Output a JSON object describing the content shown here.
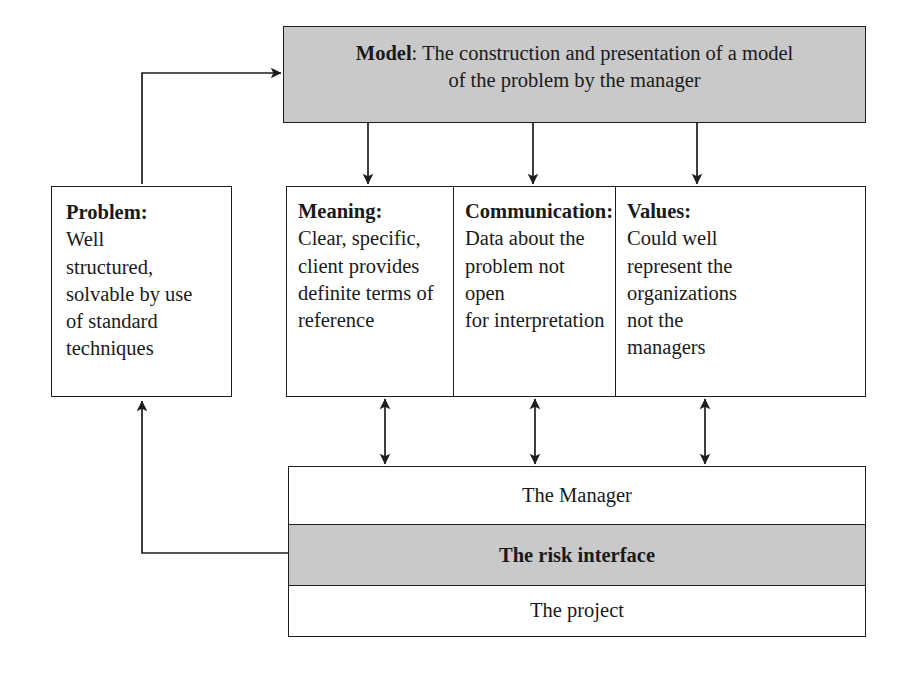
{
  "diagram": {
    "colors": {
      "shade": "#c9c9c9",
      "line": "#1d1d1d",
      "background": "#ffffff"
    },
    "model": {
      "header": "Model",
      "separator": ": ",
      "line1_rest": "The construction and presentation of a model",
      "line2": "of the problem by the manager",
      "shaded": "true"
    },
    "problem": {
      "header": "Problem:",
      "body": "Well structured, solvable by use of standard techniques",
      "lines": [
        "Well",
        "structured,",
        "solvable by use",
        "of standard",
        "techniques"
      ]
    },
    "columns": [
      {
        "header": "Meaning:",
        "body": "Clear, specific, client provides definite terms of reference",
        "lines": [
          "Clear, specific,",
          "client provides",
          "definite terms of",
          "reference"
        ]
      },
      {
        "header": "Communication:",
        "body": "Data about the problem not open for interpretation",
        "lines": [
          "Data about the",
          "problem not open",
          "for interpretation"
        ]
      },
      {
        "header": "Values:",
        "body": "Could well represent the organizations not the managers",
        "lines": [
          "Could well",
          "represent the",
          "organizations",
          "not the",
          "managers"
        ]
      }
    ],
    "stack": [
      {
        "label": "The Manager",
        "shaded": "false",
        "bold": "false"
      },
      {
        "label": "The risk interface",
        "shaded": "true",
        "bold": "true"
      },
      {
        "label": "The project",
        "shaded": "false",
        "bold": "false"
      }
    ],
    "connectors": [
      {
        "name": "model-to-meaning",
        "type": "arrow-down"
      },
      {
        "name": "model-to-communication",
        "type": "arrow-down"
      },
      {
        "name": "model-to-values",
        "type": "arrow-down"
      },
      {
        "name": "meaning-to-manager",
        "type": "arrow-double-vertical"
      },
      {
        "name": "communication-to-manager",
        "type": "arrow-double-vertical"
      },
      {
        "name": "values-to-manager",
        "type": "arrow-double-vertical"
      },
      {
        "name": "risk-interface-to-problem",
        "type": "elbow-arrow-up"
      },
      {
        "name": "problem-to-model",
        "type": "elbow-arrow-right"
      }
    ]
  }
}
